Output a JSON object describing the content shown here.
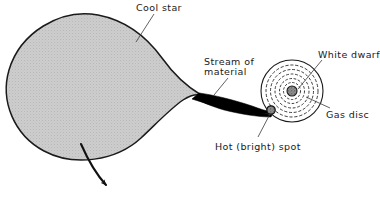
{
  "figure": {
    "type": "astronomy-diagram",
    "background_color": "#ffffff",
    "line_color": "#1a1a1a",
    "star_fill_color": "#c8c8c8",
    "stream_color": "#000000"
  },
  "labels": {
    "cool_star": "Cool star",
    "stream_line1": "Stream of",
    "stream_line2": "material",
    "white_dwarf": "White dwarf",
    "gas_disc": "Gas disc",
    "hot_spot": "Hot (bright) spot"
  },
  "icons": {
    "cool_star": "teardrop-star-icon",
    "stream": "accretion-stream-icon",
    "gas_disc": "concentric-rings-icon",
    "white_dwarf": "stippled-dot-icon",
    "hot_spot": "dark-blob-icon",
    "orbit_arrow": "curved-arrow-icon"
  },
  "geometry": {
    "star_center_x": 98,
    "star_center_y": 83,
    "star_radius_x": 95,
    "star_radius_y": 70,
    "star_cusp_x": 201,
    "star_cusp_y": 95,
    "disc_center_x": 292,
    "disc_center_y": 91,
    "disc_outer_radius": 31,
    "disc_ring_count": 6,
    "white_dwarf_radius": 5,
    "hot_spot_x": 271,
    "hot_spot_y": 110,
    "hot_spot_radius": 4
  }
}
